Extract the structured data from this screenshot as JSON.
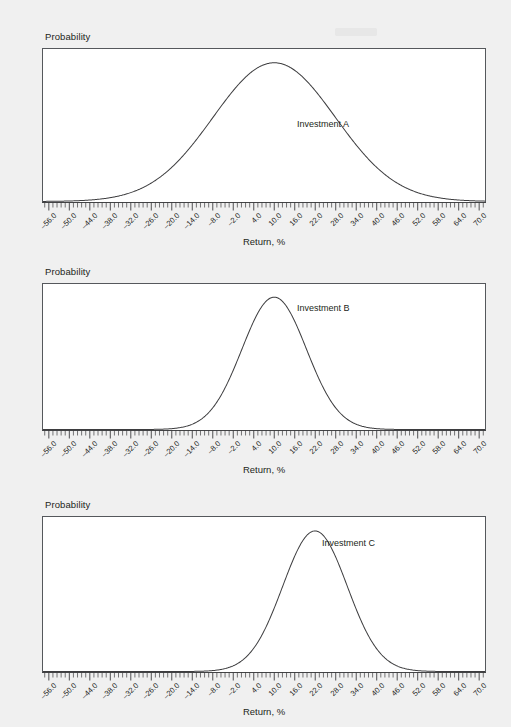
{
  "page": {
    "background_color": "#f0f0f0",
    "line_color": "#3d3d3f",
    "box_border_color": "#55585c",
    "plot_background": "#ffffff"
  },
  "axis": {
    "x_label": "Return, %",
    "y_label": "Probability",
    "tick_labels": [
      "–56.0",
      "–50.0",
      "–44.0",
      "–38.0",
      "–32.0",
      "–26.0",
      "–20.0",
      "–14.0",
      "–8.0",
      "–2.0",
      "4.0",
      "10.0",
      "16.0",
      "22.0",
      "28.0",
      "34.0",
      "40.0",
      "46.0",
      "52.0",
      "58.0",
      "64.0",
      "70.0"
    ],
    "tick_values": [
      -56,
      -50,
      -44,
      -38,
      -32,
      -26,
      -20,
      -14,
      -8,
      -2,
      4,
      10,
      16,
      22,
      28,
      34,
      40,
      46,
      52,
      58,
      64,
      70
    ],
    "minor_ticks_per_major": 4,
    "xmin": -58,
    "xmax": 72
  },
  "charts": [
    {
      "series_label": "Investment A",
      "y_axis_label": "Probability",
      "x_axis_label": "Return, %"
    },
    {
      "series_label": "Investment B",
      "y_axis_label": "Probability",
      "x_axis_label": "Return, %"
    },
    {
      "series_label": "Investment C",
      "y_axis_label": "Probability",
      "x_axis_label": "Return, %"
    }
  ],
  "chart_data": [
    {
      "type": "line",
      "title": "Investment A",
      "xlabel": "Return, %",
      "ylabel": "Probability",
      "distribution": "normal",
      "mean": 10.0,
      "std_dev": 18.0,
      "xlim": [
        -58,
        72
      ],
      "ylim": [
        0,
        1
      ],
      "grid": false,
      "legend": "inline-annotation",
      "tick_labels": [
        "–56.0",
        "–50.0",
        "–44.0",
        "–38.0",
        "–32.0",
        "–26.0",
        "–20.0",
        "–14.0",
        "–8.0",
        "–2.0",
        "4.0",
        "10.0",
        "16.0",
        "22.0",
        "28.0",
        "34.0",
        "40.0",
        "46.0",
        "52.0",
        "58.0",
        "64.0",
        "70.0"
      ],
      "x": [
        -56,
        -50,
        -44,
        -38,
        -32,
        -26,
        -20,
        -14,
        -8,
        -2,
        4,
        10,
        16,
        22,
        28,
        34,
        40,
        46,
        52,
        58,
        64,
        70
      ],
      "values": [
        0.017,
        0.033,
        0.059,
        0.097,
        0.149,
        0.215,
        0.294,
        0.38,
        0.468,
        0.549,
        0.615,
        0.658,
        0.673,
        0.658,
        0.615,
        0.549,
        0.468,
        0.38,
        0.294,
        0.215,
        0.149,
        0.097
      ]
    },
    {
      "type": "line",
      "title": "Investment B",
      "xlabel": "Return, %",
      "ylabel": "Probability",
      "distribution": "normal",
      "mean": 10.0,
      "std_dev": 9.5,
      "xlim": [
        -58,
        72
      ],
      "ylim": [
        0,
        1
      ],
      "grid": false,
      "legend": "inline-annotation",
      "tick_labels": [
        "–56.0",
        "–50.0",
        "–44.0",
        "–38.0",
        "–32.0",
        "–26.0",
        "–20.0",
        "–14.0",
        "–8.0",
        "–2.0",
        "4.0",
        "10.0",
        "16.0",
        "22.0",
        "28.0",
        "34.0",
        "40.0",
        "46.0",
        "52.0",
        "58.0",
        "64.0",
        "70.0"
      ],
      "x": [
        -56,
        -50,
        -44,
        -38,
        -32,
        -26,
        -20,
        -14,
        -8,
        -2,
        4,
        10,
        16,
        22,
        28,
        34,
        40,
        46,
        52,
        58,
        64,
        70
      ],
      "values": [
        0.0,
        0.0,
        0.0,
        0.001,
        0.004,
        0.017,
        0.058,
        0.159,
        0.348,
        0.61,
        0.852,
        0.951,
        0.852,
        0.61,
        0.348,
        0.159,
        0.058,
        0.017,
        0.004,
        0.001,
        0.0,
        0.0
      ]
    },
    {
      "type": "line",
      "title": "Investment C",
      "xlabel": "Return, %",
      "ylabel": "Probability",
      "distribution": "normal",
      "mean": 22.0,
      "std_dev": 9.5,
      "xlim": [
        -58,
        72
      ],
      "ylim": [
        0,
        1
      ],
      "grid": false,
      "legend": "inline-annotation",
      "tick_labels": [
        "–56.0",
        "–50.0",
        "–44.0",
        "–38.0",
        "–32.0",
        "–26.0",
        "–20.0",
        "–14.0",
        "–8.0",
        "–2.0",
        "4.0",
        "10.0",
        "16.0",
        "22.0",
        "28.0",
        "34.0",
        "40.0",
        "46.0",
        "52.0",
        "58.0",
        "64.0",
        "70.0"
      ],
      "x": [
        -56,
        -50,
        -44,
        -38,
        -32,
        -26,
        -20,
        -14,
        -8,
        -2,
        4,
        10,
        16,
        22,
        28,
        34,
        40,
        46,
        52,
        58,
        64,
        70
      ],
      "values": [
        0.0,
        0.0,
        0.0,
        0.0,
        0.0,
        0.0,
        0.001,
        0.004,
        0.017,
        0.058,
        0.159,
        0.348,
        0.61,
        0.852,
        0.951,
        0.852,
        0.61,
        0.348,
        0.159,
        0.058,
        0.017,
        0.004
      ]
    }
  ]
}
